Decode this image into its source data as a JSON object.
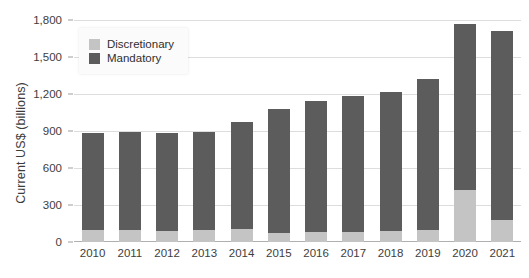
{
  "chart_data": {
    "type": "bar",
    "stacked": true,
    "title": "",
    "subtitle": "",
    "xlabel": "",
    "ylabel": "Current US$ (billions)",
    "ylim": [
      0,
      1800
    ],
    "yticks": [
      "0",
      "300",
      "600",
      "900",
      "1,200",
      "1,500",
      "1,800"
    ],
    "ytick_values": [
      0,
      300,
      600,
      900,
      1200,
      1500,
      1800
    ],
    "grid": true,
    "legend_position": "top-left-inside",
    "categories": [
      "2010",
      "2011",
      "2012",
      "2013",
      "2014",
      "2015",
      "2016",
      "2017",
      "2018",
      "2019",
      "2020",
      "2021"
    ],
    "series": [
      {
        "name": "Discretionary",
        "color": "#c4c4c4",
        "values": [
          95,
          95,
          90,
          95,
          105,
          75,
          80,
          80,
          90,
          95,
          420,
          175
        ]
      },
      {
        "name": "Mandatory",
        "color": "#5c5c5c",
        "values": [
          790,
          795,
          790,
          795,
          865,
          1000,
          1060,
          1100,
          1125,
          1225,
          1350,
          1540
        ]
      }
    ],
    "totals": [
      885,
      890,
      880,
      890,
      970,
      1075,
      1140,
      1180,
      1215,
      1320,
      1770,
      1715
    ]
  },
  "legend": {
    "items": [
      {
        "label": "Discretionary",
        "color": "#c4c4c4"
      },
      {
        "label": "Mandatory",
        "color": "#5c5c5c"
      }
    ]
  },
  "axes": {
    "y_title": "Current US$ (billions)"
  }
}
